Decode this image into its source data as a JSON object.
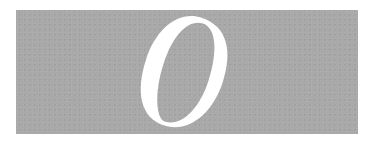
{
  "dropcap": {
    "letter": "O",
    "style": "italic-serif",
    "colors": {
      "box_background": "#a9a9a9",
      "letter_fill": "#ffffff",
      "page_background": "#ffffff"
    }
  }
}
